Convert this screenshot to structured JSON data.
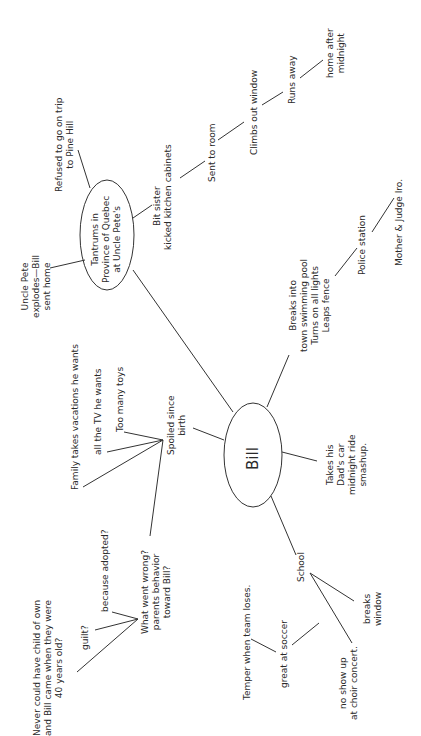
{
  "diagram": {
    "type": "mind-map",
    "orientation": "rotated-90-ccw",
    "center": {
      "label": "Bill"
    },
    "branches": {
      "tantrums": {
        "lines": [
          "Tantrums in",
          "Province of Quebec",
          "at Uncle Pete's"
        ],
        "refused": [
          "Refused to go on trip",
          "to Pine Hill"
        ],
        "uncle_pete": [
          "Uncle Pete",
          "explodes—Bill",
          "sent home"
        ],
        "bit_sister": [
          "Bit sister",
          "kicked kitchen cabinets"
        ],
        "sent_to_room": "Sent to room",
        "climbs_out": "Climbs out window",
        "runs_away": "Runs away",
        "home_after": [
          "home after",
          "midnight"
        ]
      },
      "pool": {
        "lines": [
          "Breaks into",
          "town swimming pool",
          "Turns on all lights",
          "Leaps fence"
        ],
        "police": "Police station",
        "mother_judge": "Mother & Judge Iro."
      },
      "car": {
        "lines": [
          "Takes his",
          "Dad's car",
          "midnight ride",
          "smashup."
        ]
      },
      "school": {
        "label": "School",
        "breaks_window": [
          "breaks",
          "window"
        ],
        "great_soccer": "great at soccer",
        "temper": "Temper when team loses.",
        "no_show": [
          "no show up",
          "at choir concert."
        ]
      },
      "spoiled": {
        "lines": [
          "Spoiled since",
          "birth"
        ],
        "too_many_toys": "Too many toys",
        "all_tv": "all the TV he wants",
        "vacations": "Family takes vacations he wants",
        "what_went_wrong": [
          "What went wrong?",
          "parents behavior",
          "toward Bill?"
        ],
        "adopted": "because adopted?",
        "guilt": "guilt?",
        "never_child": [
          "Never could have child of own",
          "and Bill came when they were",
          "40 years old?"
        ]
      }
    }
  }
}
